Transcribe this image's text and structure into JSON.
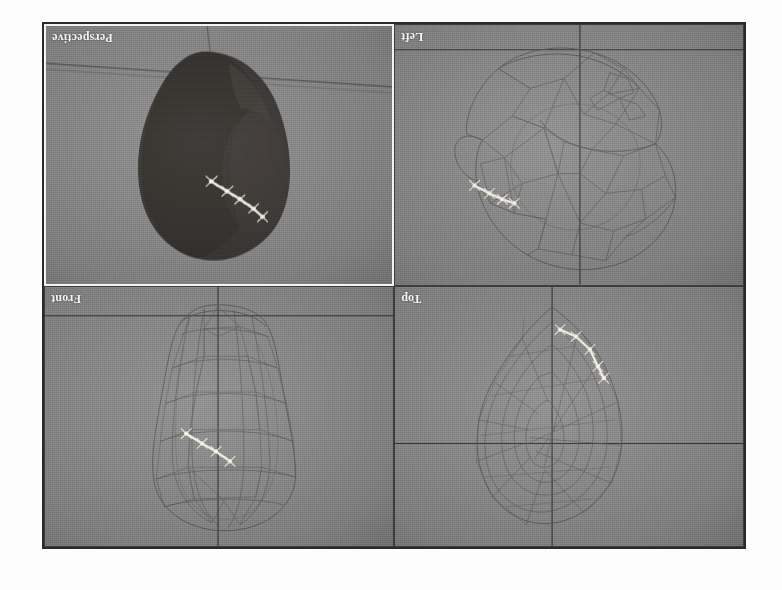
{
  "app": {
    "title": "3D Modeling Application — Quad Viewport Layout",
    "background_color": "#8a8a8a",
    "frame_color": "#2a2a2a",
    "active_viewport_border_color": "#f2f2f2",
    "orientation_note": "captured image is rotated 180 degrees; viewport labels read upside-down"
  },
  "viewports": [
    {
      "id": "perspective",
      "label": "Perspective",
      "position": "top-left",
      "active": true,
      "shade_mode": "smooth-shaded",
      "object_color": "#3b3734",
      "grid": {
        "type": "perspective-horizon",
        "lines": 2,
        "color": "#2f2f2f"
      },
      "selection": {
        "type": "edge-chain",
        "color": "#f4efe2",
        "segments": 5,
        "visible": true
      }
    },
    {
      "id": "left",
      "label": "Left",
      "position": "top-right",
      "active": false,
      "shade_mode": "wireframe",
      "object_color": "#5d5d5d",
      "grid": {
        "type": "axis-cross",
        "lines": 2,
        "color": "#2f2f2f"
      },
      "selection": {
        "type": "edge-chain",
        "color": "#f4efe2",
        "segments": 5,
        "visible": true
      }
    },
    {
      "id": "front",
      "label": "Front",
      "position": "bottom-left",
      "active": false,
      "shade_mode": "wireframe",
      "object_color": "#5d5d5d",
      "grid": {
        "type": "axis-cross",
        "lines": 2,
        "color": "#2f2f2f"
      },
      "selection": {
        "type": "edge-chain",
        "color": "#f4efe2",
        "segments": 5,
        "visible": true
      }
    },
    {
      "id": "top",
      "label": "Top",
      "position": "bottom-right",
      "active": false,
      "shade_mode": "wireframe",
      "object_color": "#5d5d5d",
      "grid": {
        "type": "axis-cross",
        "lines": 2,
        "color": "#2f2f2f"
      },
      "selection": {
        "type": "edge-chain",
        "color": "#f4efe2",
        "segments": 5,
        "visible": true
      }
    }
  ]
}
